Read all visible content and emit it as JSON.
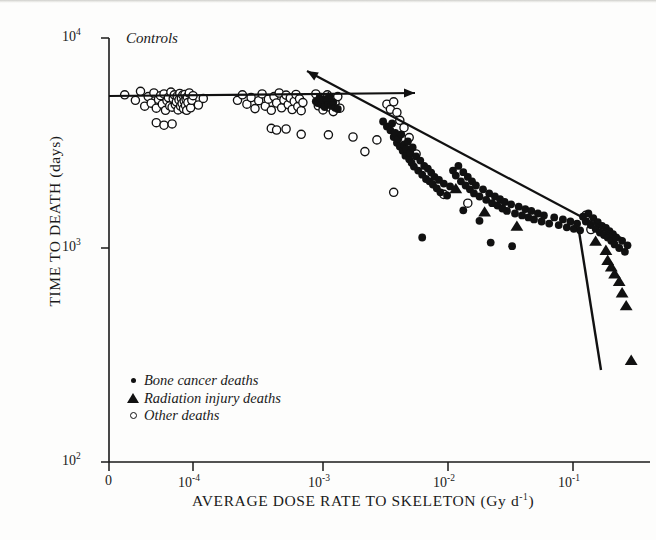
{
  "chart_data": {
    "type": "scatter",
    "title": "",
    "xlabel": "AVERAGE DOSE RATE TO SKELETON (Gy d⁻¹)",
    "ylabel": "TIME TO DEATH  (days)",
    "xscale": "log-with-zero-break",
    "yscale": "log",
    "xticks": [
      "0",
      "10⁻⁴",
      "10⁻³",
      "10⁻²",
      "10⁻¹"
    ],
    "xtick_values": [
      0,
      0.0001,
      0.001,
      0.01,
      0.1
    ],
    "yticks": [
      "10²",
      "10³",
      "10⁴"
    ],
    "ytick_values": [
      100,
      1000,
      10000
    ],
    "ylim": [
      100,
      10000
    ],
    "grid": false,
    "legend_position": "lower-left-inside",
    "annotations": [
      {
        "text": "Controls",
        "x_px": 126,
        "y_px": 30,
        "style": "italic"
      }
    ],
    "series": [
      {
        "name": "Bone cancer deaths",
        "marker": "filled-circle",
        "color": "#111111",
        "points": [
          [
            0.00088,
            4850
          ],
          [
            0.00091,
            4760
          ],
          [
            0.00094,
            5020
          ],
          [
            0.00097,
            4680
          ],
          [
            0.001,
            4900
          ],
          [
            0.00103,
            4560
          ],
          [
            0.00106,
            4980
          ],
          [
            0.0011,
            4700
          ],
          [
            0.00113,
            5100
          ],
          [
            0.00116,
            4620
          ],
          [
            0.0012,
            4800
          ],
          [
            0.00124,
            4520
          ],
          [
            0.0013,
            4460
          ],
          [
            0.0029,
            3900
          ],
          [
            0.0031,
            3700
          ],
          [
            0.0033,
            3550
          ],
          [
            0.0034,
            3820
          ],
          [
            0.0035,
            3300
          ],
          [
            0.0036,
            3450
          ],
          [
            0.0037,
            3100
          ],
          [
            0.0038,
            3250
          ],
          [
            0.0039,
            2980
          ],
          [
            0.004,
            3400
          ],
          [
            0.0041,
            2850
          ],
          [
            0.0042,
            3050
          ],
          [
            0.0043,
            2700
          ],
          [
            0.0044,
            2900
          ],
          [
            0.0045,
            3150
          ],
          [
            0.0046,
            2600
          ],
          [
            0.0047,
            2780
          ],
          [
            0.0048,
            2500
          ],
          [
            0.0049,
            2950
          ],
          [
            0.005,
            2400
          ],
          [
            0.0052,
            2680
          ],
          [
            0.0054,
            2300
          ],
          [
            0.0056,
            2560
          ],
          [
            0.0058,
            2200
          ],
          [
            0.006,
            2420
          ],
          [
            0.0062,
            2100
          ],
          [
            0.0064,
            2350
          ],
          [
            0.0066,
            2050
          ],
          [
            0.0068,
            2250
          ],
          [
            0.007,
            1980
          ],
          [
            0.0072,
            2150
          ],
          [
            0.0075,
            1900
          ],
          [
            0.0078,
            2080
          ],
          [
            0.008,
            1820
          ],
          [
            0.0085,
            2000
          ],
          [
            0.009,
            1760
          ],
          [
            0.0095,
            1940
          ],
          [
            0.01,
            2300
          ],
          [
            0.0105,
            2180
          ],
          [
            0.011,
            2420
          ],
          [
            0.0115,
            2050
          ],
          [
            0.012,
            2260
          ],
          [
            0.0125,
            1960
          ],
          [
            0.013,
            2150
          ],
          [
            0.0135,
            1880
          ],
          [
            0.014,
            2050
          ],
          [
            0.0145,
            1800
          ],
          [
            0.015,
            1960
          ],
          [
            0.016,
            1740
          ],
          [
            0.017,
            1880
          ],
          [
            0.018,
            1680
          ],
          [
            0.019,
            1800
          ],
          [
            0.02,
            1620
          ],
          [
            0.021,
            1740
          ],
          [
            0.022,
            1580
          ],
          [
            0.023,
            1690
          ],
          [
            0.024,
            1530
          ],
          [
            0.025,
            1640
          ],
          [
            0.026,
            1490
          ],
          [
            0.028,
            1600
          ],
          [
            0.03,
            1450
          ],
          [
            0.032,
            1560
          ],
          [
            0.034,
            1420
          ],
          [
            0.036,
            1520
          ],
          [
            0.038,
            1390
          ],
          [
            0.04,
            1490
          ],
          [
            0.042,
            1360
          ],
          [
            0.045,
            1450
          ],
          [
            0.048,
            1330
          ],
          [
            0.05,
            1420
          ],
          [
            0.055,
            1300
          ],
          [
            0.06,
            1390
          ],
          [
            0.065,
            1280
          ],
          [
            0.07,
            1360
          ],
          [
            0.075,
            1250
          ],
          [
            0.08,
            1330
          ],
          [
            0.085,
            1230
          ],
          [
            0.09,
            1300
          ],
          [
            0.095,
            1210
          ],
          [
            0.1,
            1400
          ],
          [
            0.105,
            1330
          ],
          [
            0.11,
            1450
          ],
          [
            0.115,
            1280
          ],
          [
            0.12,
            1380
          ],
          [
            0.125,
            1230
          ],
          [
            0.13,
            1320
          ],
          [
            0.135,
            1180
          ],
          [
            0.14,
            1270
          ],
          [
            0.145,
            1150
          ],
          [
            0.15,
            1240
          ],
          [
            0.155,
            1120
          ],
          [
            0.16,
            1200
          ],
          [
            0.165,
            1080
          ],
          [
            0.17,
            1160
          ],
          [
            0.175,
            1040
          ],
          [
            0.18,
            1120
          ],
          [
            0.19,
            1000
          ],
          [
            0.2,
            1080
          ],
          [
            0.21,
            960
          ],
          [
            0.22,
            1030
          ],
          [
            0.0058,
            1120
          ],
          [
            0.0195,
            1060
          ],
          [
            0.0285,
            1020
          ],
          [
            0.012,
            1500
          ],
          [
            0.016,
            1340
          ]
        ]
      },
      {
        "name": "Radiation injury deaths",
        "marker": "filled-triangle",
        "color": "#111111",
        "points": [
          [
            0.0011,
            5100
          ],
          [
            0.0105,
            1900
          ],
          [
            0.0175,
            1480
          ],
          [
            0.031,
            1270
          ],
          [
            0.125,
            1080
          ],
          [
            0.15,
            980
          ],
          [
            0.155,
            880
          ],
          [
            0.165,
            820
          ],
          [
            0.175,
            760
          ],
          [
            0.19,
            700
          ],
          [
            0.2,
            620
          ],
          [
            0.215,
            540
          ],
          [
            0.235,
            300
          ]
        ]
      },
      {
        "name": "Other deaths",
        "marker": "open-circle",
        "color": "#111111",
        "points": [
          [
            5e-06,
            5200
          ],
          [
            8e-06,
            4900
          ],
          [
            1e-05,
            5400
          ],
          [
            1.2e-05,
            4600
          ],
          [
            1.4e-05,
            5100
          ],
          [
            1.6e-05,
            4750
          ],
          [
            1.8e-05,
            5300
          ],
          [
            2e-05,
            4500
          ],
          [
            2.2e-05,
            4950
          ],
          [
            2.4e-05,
            5150
          ],
          [
            2.6e-05,
            4700
          ],
          [
            2.8e-05,
            5250
          ],
          [
            3e-05,
            4400
          ],
          [
            3.2e-05,
            4880
          ],
          [
            3.4e-05,
            5050
          ],
          [
            3.6e-05,
            4620
          ],
          [
            3.8e-05,
            5350
          ],
          [
            4e-05,
            4550
          ],
          [
            4.2e-05,
            4980
          ],
          [
            4.4e-05,
            5200
          ],
          [
            4.6e-05,
            4680
          ],
          [
            4.8e-05,
            4820
          ],
          [
            5e-05,
            5120
          ],
          [
            5.2e-05,
            4420
          ],
          [
            5.4e-05,
            4920
          ],
          [
            5.6e-05,
            5280
          ],
          [
            5.8e-05,
            4600
          ],
          [
            6e-05,
            5000
          ],
          [
            6.2e-05,
            4740
          ],
          [
            6.4e-05,
            5180
          ],
          [
            6.6e-05,
            4480
          ],
          [
            6.8e-05,
            4860
          ],
          [
            7e-05,
            5220
          ],
          [
            7.2e-05,
            4640
          ],
          [
            7.4e-05,
            4960
          ],
          [
            7.6e-05,
            4400
          ],
          [
            7.8e-05,
            5080
          ],
          [
            8e-05,
            4780
          ],
          [
            8.5e-05,
            5300
          ],
          [
            9e-05,
            4520
          ],
          [
            9.5e-05,
            4900
          ],
          [
            0.0001,
            5150
          ],
          [
            0.00011,
            4660
          ],
          [
            0.00012,
            5000
          ],
          [
            2e-05,
            3850
          ],
          [
            2.8e-05,
            3750
          ],
          [
            4e-05,
            3800
          ],
          [
            0.00022,
            4900
          ],
          [
            0.00024,
            5200
          ],
          [
            0.00026,
            4700
          ],
          [
            0.00028,
            5050
          ],
          [
            0.0003,
            4480
          ],
          [
            0.00032,
            4880
          ],
          [
            0.00034,
            5250
          ],
          [
            0.00036,
            4600
          ],
          [
            0.00038,
            4960
          ],
          [
            0.0004,
            4400
          ],
          [
            0.00042,
            5100
          ],
          [
            0.00044,
            4760
          ],
          [
            0.00046,
            5300
          ],
          [
            0.00048,
            4520
          ],
          [
            0.0005,
            4920
          ],
          [
            0.00052,
            5180
          ],
          [
            0.00054,
            4680
          ],
          [
            0.00056,
            5020
          ],
          [
            0.00058,
            4440
          ],
          [
            0.0006,
            4840
          ],
          [
            0.00062,
            5220
          ],
          [
            0.00064,
            4580
          ],
          [
            0.00066,
            4980
          ],
          [
            0.00068,
            4380
          ],
          [
            0.0007,
            4780
          ],
          [
            0.0004,
            3620
          ],
          [
            0.00044,
            3560
          ],
          [
            0.00052,
            3600
          ],
          [
            0.00068,
            3400
          ],
          [
            0.00088,
            5250
          ],
          [
            0.00092,
            4620
          ],
          [
            0.00096,
            5050
          ],
          [
            0.001,
            4420
          ],
          [
            0.00104,
            4880
          ],
          [
            0.00108,
            5200
          ],
          [
            0.00112,
            4560
          ],
          [
            0.00116,
            4940
          ],
          [
            0.0012,
            4340
          ],
          [
            0.00124,
            4760
          ],
          [
            0.0013,
            5100
          ],
          [
            0.00135,
            4500
          ],
          [
            0.0011,
            3380
          ],
          [
            0.0017,
            3300
          ],
          [
            0.0021,
            2820
          ],
          [
            0.0026,
            3200
          ],
          [
            0.0031,
            4700
          ],
          [
            0.0033,
            4450
          ],
          [
            0.0035,
            4820
          ],
          [
            0.0037,
            4300
          ],
          [
            0.0039,
            3950
          ],
          [
            0.0042,
            3650
          ],
          [
            0.0046,
            3280
          ],
          [
            0.0052,
            2750
          ],
          [
            0.0035,
            1820
          ],
          [
            0.0085,
            1780
          ],
          [
            0.013,
            1620
          ],
          [
            0.105,
            1420
          ],
          [
            0.115,
            1220
          ]
        ]
      }
    ],
    "fit_lines": [
      {
        "name": "control-plateau-line",
        "style": "solid-with-left-arrowhead-and-right-arrowhead",
        "x_px": [
          109,
          415
        ],
        "y_px": [
          96,
          93
        ]
      },
      {
        "name": "dose-response-regression-line",
        "style": "solid-with-upper-left-arrowhead",
        "x_px": [
          307,
          625
        ],
        "y_px": [
          71,
          240
        ]
      },
      {
        "name": "radiation-injury-steep-line",
        "style": "solid",
        "x_px": [
          578,
          601
        ],
        "y_px": [
          225,
          370
        ]
      }
    ]
  },
  "axes": {
    "x_title": "AVERAGE DOSE RATE TO SKELETON (Gy d",
    "x_title_sup": "-1",
    "x_title_tail": ")",
    "y_title": "TIME TO DEATH  (days)",
    "xticks": [
      {
        "label": "0",
        "sup": ""
      },
      {
        "label": "10",
        "sup": "-4"
      },
      {
        "label": "10",
        "sup": "-3"
      },
      {
        "label": "10",
        "sup": "-2"
      },
      {
        "label": "10",
        "sup": "-1"
      }
    ],
    "yticks": [
      {
        "label": "10",
        "sup": "4"
      },
      {
        "label": "10",
        "sup": "3"
      },
      {
        "label": "10",
        "sup": "2"
      }
    ]
  },
  "annotations": {
    "controls": "Controls"
  },
  "legend": {
    "items": [
      {
        "marker": "filled-circle",
        "label": "Bone cancer deaths"
      },
      {
        "marker": "filled-triangle",
        "label": "Radiation injury deaths"
      },
      {
        "marker": "open-circle",
        "label": "Other deaths"
      }
    ]
  },
  "colors": {
    "ink": "#111111",
    "paper": "#fdfdfc"
  }
}
